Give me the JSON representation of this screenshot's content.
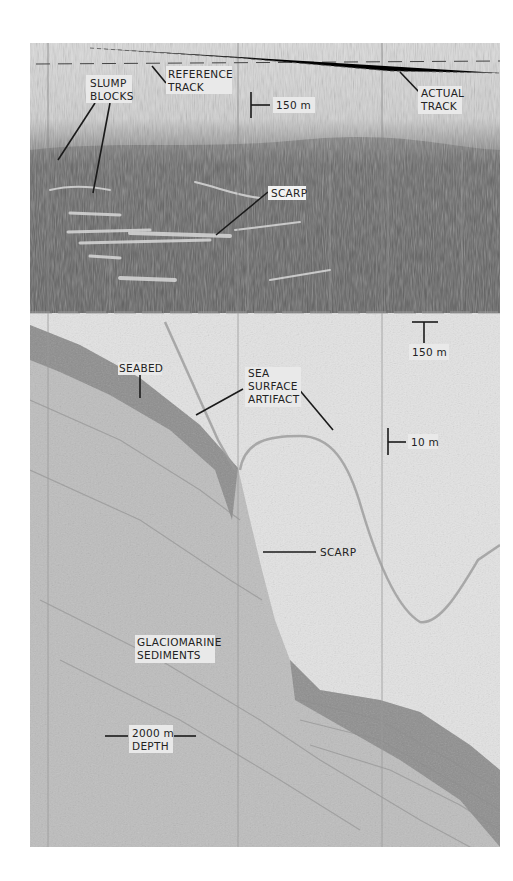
{
  "figure": {
    "type": "side-scan sonar and sub-bottom seismic profile record",
    "colors": {
      "paper": "#ffffff",
      "record_light": "#dedede",
      "record_dark": "#5a5a5a",
      "annotation": "#1a1a1a"
    }
  },
  "top_panel": {
    "name": "sidescan-record",
    "labels": {
      "slump_blocks": [
        "SLUMP",
        "BLOCKS"
      ],
      "reference_track": [
        "REFERENCE",
        "TRACK"
      ],
      "actual_track": [
        "ACTUAL",
        "TRACK"
      ],
      "scarp": "SCARP"
    },
    "scale_bars": {
      "vertical": "150 m",
      "horizontal": "150 m"
    }
  },
  "bottom_panel": {
    "name": "seismic-profile",
    "labels": {
      "seabed": "SEABED",
      "sea_surface_artifact": [
        "SEA",
        "SURFACE",
        "ARTIFACT"
      ],
      "scarp": "SCARP",
      "glaciomarine_sediments": [
        "GLACIOMARINE",
        "SEDIMENTS"
      ],
      "depth": [
        "2000 m",
        "DEPTH"
      ]
    },
    "scale_bars": {
      "vertical": "10 m"
    }
  }
}
